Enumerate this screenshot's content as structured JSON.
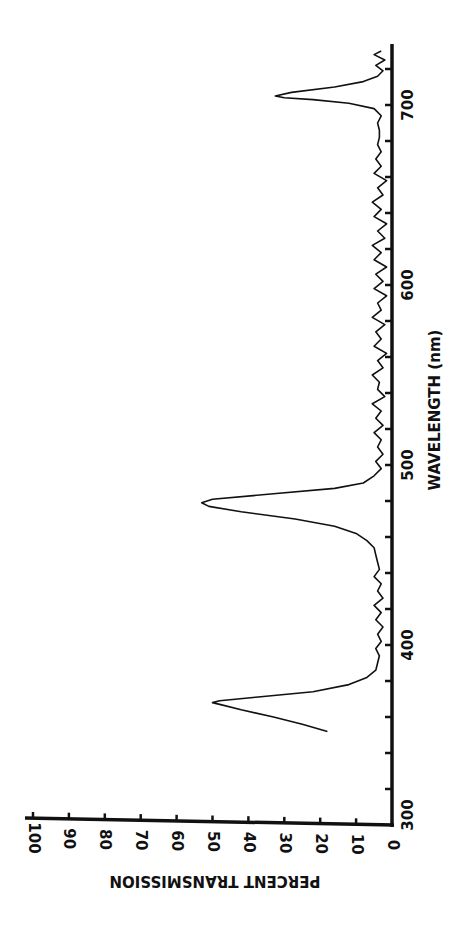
{
  "chart_data": {
    "type": "line",
    "orientation_note": "figure rotated 90 degrees clockwise on page",
    "title": "",
    "xlabel": "WAVELENGTH (nm)",
    "ylabel": "PERCENT TRANSMISSION",
    "xlim": [
      300,
      734
    ],
    "ylim": [
      0,
      100
    ],
    "x_ticks": [
      300,
      320,
      340,
      360,
      380,
      400,
      420,
      440,
      460,
      480,
      500,
      520,
      540,
      560,
      580,
      600,
      620,
      640,
      660,
      680,
      700,
      720
    ],
    "x_tick_labels": [
      {
        "value": 300,
        "label": "300"
      },
      {
        "value": 400,
        "label": "400"
      },
      {
        "value": 500,
        "label": "500"
      },
      {
        "value": 600,
        "label": "600"
      },
      {
        "value": 700,
        "label": "700"
      }
    ],
    "y_ticks": [
      0,
      10,
      20,
      30,
      40,
      50,
      60,
      70,
      80,
      90,
      100
    ],
    "y_tick_labels": [
      "0",
      "10",
      "20",
      "30",
      "40",
      "50",
      "60",
      "70",
      "80",
      "90",
      "100"
    ],
    "grid": false,
    "legend": null,
    "series": [
      {
        "name": "Transmission",
        "x": [
          352,
          356,
          360,
          364,
          367,
          368,
          369,
          371,
          374,
          378,
          382,
          386,
          390,
          394,
          398,
          402,
          406,
          410,
          414,
          418,
          422,
          426,
          430,
          434,
          438,
          442,
          446,
          450,
          454,
          458,
          462,
          466,
          470,
          474,
          477,
          479,
          481,
          484,
          487,
          490,
          494,
          498,
          502,
          506,
          510,
          514,
          518,
          522,
          526,
          530,
          534,
          538,
          542,
          546,
          550,
          554,
          558,
          562,
          566,
          570,
          574,
          578,
          582,
          586,
          590,
          594,
          598,
          602,
          606,
          610,
          614,
          618,
          622,
          626,
          630,
          634,
          638,
          642,
          646,
          650,
          654,
          658,
          662,
          666,
          670,
          674,
          678,
          682,
          686,
          690,
          694,
          698,
          701,
          703,
          704,
          705,
          707,
          710,
          713,
          716,
          719,
          722,
          725,
          728,
          730
        ],
        "y": [
          18,
          25,
          33,
          42,
          48,
          50,
          48,
          38,
          22,
          12,
          7,
          4.5,
          4,
          3.5,
          4.5,
          3,
          4,
          2.5,
          4.5,
          3,
          5,
          2.5,
          4,
          3,
          5,
          3.5,
          4,
          4.5,
          5,
          7,
          10,
          16,
          27,
          42,
          51,
          53,
          50,
          33,
          16,
          8,
          5,
          3,
          4.5,
          2.5,
          4,
          3,
          5,
          2.5,
          4.5,
          3,
          5.5,
          2,
          4,
          3.5,
          5.5,
          2.5,
          4,
          1.5,
          5,
          3,
          4.5,
          2,
          5.5,
          3,
          4,
          1.5,
          5,
          2.5,
          4.5,
          1.5,
          5,
          3,
          5.5,
          2,
          4,
          1.5,
          5,
          3,
          5.5,
          2.5,
          4,
          1.5,
          5,
          3,
          4.5,
          3,
          4,
          3.5,
          3.5,
          4,
          3,
          5,
          12,
          22,
          30,
          32.5,
          28,
          16,
          8,
          4,
          2.5,
          4.5,
          2,
          5,
          3
        ]
      }
    ],
    "peaks": [
      {
        "wavelength_nm": 368,
        "percent_transmission": 50
      },
      {
        "wavelength_nm": 479,
        "percent_transmission": 53
      },
      {
        "wavelength_nm": 704,
        "percent_transmission": 32.5
      }
    ]
  }
}
